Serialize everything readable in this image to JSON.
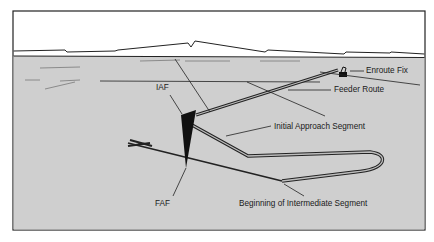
{
  "figure": {
    "colors": {
      "ground": "#cfcfcf",
      "sky": "#ffffff",
      "ink": "#1a1a1a",
      "frame": "#222222"
    },
    "labels": {
      "enroute_fix": "Enroute Fix",
      "feeder_route": "Feeder Route",
      "iaf": "IAF",
      "initial_approach_segment": "Initial Approach Segment",
      "faf": "FAF",
      "beginning_intermediate_segment": "Beginning of Intermediate Segment"
    }
  }
}
